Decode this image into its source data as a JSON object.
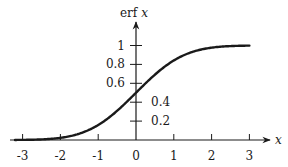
{
  "chart_data": {
    "type": "line",
    "title": "",
    "xlabel": "x",
    "ylabel": "erf x",
    "xlim": [
      -3.3,
      3.5
    ],
    "ylim": [
      0,
      1.2
    ],
    "grid": false,
    "legend": null,
    "x_ticks": [
      -3,
      -2,
      -1,
      0,
      1,
      2,
      3
    ],
    "x_tick_labels": [
      "-3",
      "-2",
      "-1",
      "0",
      "1",
      "2",
      "3"
    ],
    "y_ticks": [
      0.2,
      0.4,
      0.6,
      0.8,
      1
    ],
    "y_tick_labels": [
      "0.2",
      "0.4",
      "0.6",
      "0.8",
      "1"
    ],
    "series": [
      {
        "name": "erf x",
        "x": [
          -3.2,
          -3,
          -2.5,
          -2,
          -1.5,
          -1,
          -0.5,
          0,
          0.5,
          1,
          1.5,
          2,
          2.5,
          3
        ],
        "values": [
          0.001,
          0.001,
          0.006,
          0.023,
          0.067,
          0.159,
          0.309,
          0.5,
          0.691,
          0.841,
          0.933,
          0.977,
          0.994,
          0.999
        ]
      }
    ],
    "colors": {
      "curve": "#1a1a1a",
      "axes": "#1a1a1a",
      "background": "#ffffff"
    }
  },
  "labels": {
    "y_axis": "erf",
    "y_axis_var": "x",
    "x_axis": "x"
  }
}
